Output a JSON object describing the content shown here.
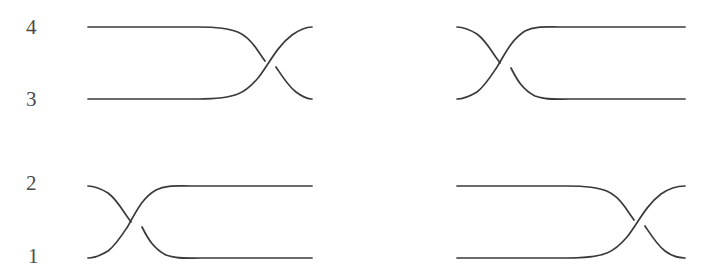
{
  "figure": {
    "kind": "braid-crossing-diagram",
    "background_color": "#ffffff",
    "stroke_color": "#3a3a3a",
    "stroke_width": 1.7,
    "width": 709,
    "height": 280,
    "panel_count": 4
  },
  "labels": {
    "row_top": {
      "upper": "4",
      "lower": "3"
    },
    "row_bottom": {
      "upper": "2",
      "lower": "1"
    }
  },
  "panels": [
    {
      "id": "top-left",
      "label_upper": "4",
      "label_lower": "3",
      "crossing_side": "right",
      "crossing_x": 268,
      "crossing_y": 63,
      "over_strand": "lower-left-to-upper-right",
      "under_strand": "upper-left-to-lower-right",
      "line_y_upper": 27,
      "line_y_lower": 99,
      "x_start": 88,
      "x_end": 312
    },
    {
      "id": "top-right",
      "label_upper": "4",
      "label_lower": "3",
      "crossing_side": "left",
      "crossing_x": 508,
      "crossing_y": 63,
      "over_strand": "lower-left-to-upper-right",
      "under_strand": "upper-left-to-lower-right",
      "line_y_upper": 27,
      "line_y_lower": 99,
      "x_start": 457,
      "x_end": 683
    },
    {
      "id": "bottom-left",
      "label_upper": "2",
      "label_lower": "1",
      "crossing_side": "left",
      "crossing_x": 141,
      "crossing_y": 221,
      "over_strand": "lower-left-to-upper-right",
      "under_strand": "upper-left-to-lower-right",
      "line_y_upper": 183,
      "line_y_lower": 258,
      "x_start": 88,
      "x_end": 312
    },
    {
      "id": "bottom-right",
      "label_upper": "2",
      "label_lower": "1",
      "crossing_side": "right",
      "crossing_x": 637,
      "crossing_y": 221,
      "over_strand": "lower-left-to-upper-right",
      "under_strand": "upper-left-to-lower-right",
      "line_y_upper": 183,
      "line_y_lower": 258,
      "x_start": 457,
      "x_end": 683
    }
  ]
}
